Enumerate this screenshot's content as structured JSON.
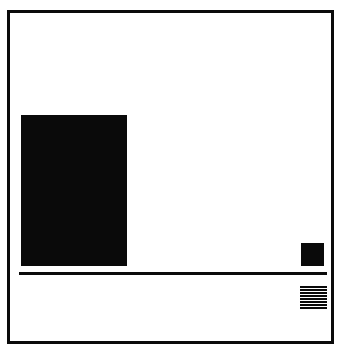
{
  "composition": {
    "title": "Abstract Geometric Composition",
    "style": "minimalist-constructivist",
    "canvas": {
      "width_px": 348,
      "height_px": 353,
      "background_color": "#ffffff",
      "outer_margin_color": "#fcfcfc"
    },
    "palette": {
      "ink": "#0a0a0a",
      "paper": "#ffffff",
      "paper_tone": "#fdfdfd"
    },
    "frame": {
      "name": "outer-border-frame",
      "x": 7,
      "y": 10,
      "width": 327,
      "height": 334,
      "stroke_width_px": 3,
      "stroke_color": "#0a0a0a",
      "fill": "none"
    },
    "elements": [
      {
        "id": "large-block",
        "shape": "rectangle",
        "label": "Large solid black rectangle",
        "x": 21,
        "y": 115,
        "width": 106,
        "height": 151,
        "fill": "#0a0a0a"
      },
      {
        "id": "small-block",
        "shape": "square",
        "label": "Small solid black square",
        "x": 301,
        "y": 243,
        "width": 23,
        "height": 23,
        "fill": "#0a0a0a"
      },
      {
        "id": "rule",
        "shape": "horizontal-line",
        "label": "Long horizontal rule",
        "x": 19,
        "y": 272,
        "width": 308,
        "height": 3,
        "fill": "#0a0a0a"
      },
      {
        "id": "striped-block",
        "shape": "striped-rectangle",
        "label": "Horizontally striped hatch block",
        "x": 300,
        "y": 286,
        "width": 27,
        "height": 23,
        "fill": "#0a0a0a",
        "stripe_count": 8,
        "stripe_thickness_px": 1.7
      }
    ],
    "stripes": [
      1,
      2,
      3,
      4,
      5,
      6,
      7,
      8
    ]
  }
}
